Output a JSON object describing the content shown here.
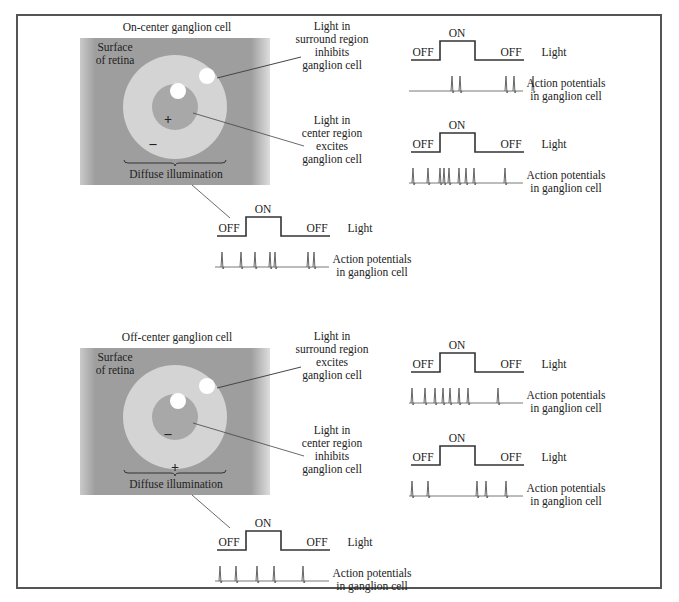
{
  "colors": {
    "frame": "#555555",
    "retina_bg": "#9e9e9e",
    "surround": "#d4d4d4",
    "center": "#a8a8a8",
    "spot": "#ffffff",
    "trace": "#333333",
    "spike": "#555555",
    "leader": "#444444"
  },
  "panels": [
    {
      "id": "on-center",
      "title": "On-center ganglion cell",
      "surface_label": [
        "Surface",
        "of retina"
      ],
      "center_sign": "+",
      "surround_sign": "–",
      "diffuse_label": "Diffuse illumination",
      "surround_callout": [
        "Light in",
        "surround region",
        "inhibits",
        "ganglion cell"
      ],
      "center_callout": [
        "Light in",
        "center region",
        "excites",
        "ganglion cell"
      ]
    },
    {
      "id": "off-center",
      "title": "Off-center ganglion cell",
      "surface_label": [
        "Surface",
        "of retina"
      ],
      "center_sign": "–",
      "surround_sign": "+",
      "diffuse_label": "Diffuse illumination",
      "surround_callout": [
        "Light in",
        "surround region",
        "excites",
        "ganglion cell"
      ],
      "center_callout": [
        "Light in",
        "center region",
        "inhibits",
        "ganglion cell"
      ]
    }
  ],
  "stimulus": {
    "off_label": "OFF",
    "on_label": "ON",
    "light_label": "Light",
    "ap_label": [
      "Action potentials",
      "in ganglion cell"
    ]
  },
  "traces": [
    {
      "id": "on-surround",
      "x": 411,
      "y": 60,
      "spikes": [
        452,
        460,
        506,
        514,
        533
      ]
    },
    {
      "id": "on-center",
      "x": 411,
      "y": 152,
      "spikes": [
        413,
        428,
        440,
        444,
        449,
        459,
        466,
        474,
        505
      ]
    },
    {
      "id": "on-diffuse",
      "x": 217,
      "y": 236,
      "spikes": [
        222,
        241,
        255,
        270,
        275,
        308,
        314
      ]
    },
    {
      "id": "off-surround",
      "x": 411,
      "y": 372,
      "spikes": [
        412,
        425,
        435,
        443,
        450,
        459,
        468,
        498
      ]
    },
    {
      "id": "off-center",
      "x": 411,
      "y": 465,
      "spikes": [
        412,
        428,
        477,
        486,
        506
      ]
    },
    {
      "id": "off-diffuse",
      "x": 217,
      "y": 550,
      "spikes": [
        220,
        236,
        257,
        274,
        303
      ]
    }
  ]
}
